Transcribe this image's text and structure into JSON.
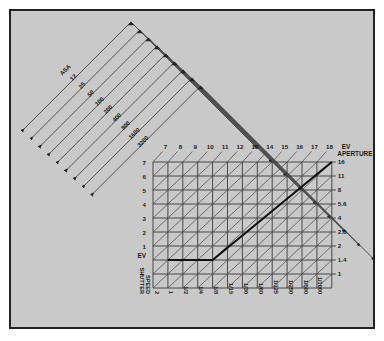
{
  "frame": {
    "background_color": "#c9c9c9",
    "border_color": "#232323",
    "page_color": "#ffffff"
  },
  "axes": {
    "ev_top": {
      "label": "EV",
      "name": "exposure-value",
      "ticks": [
        "7",
        "8",
        "9",
        "10",
        "11",
        "12",
        "13",
        "14",
        "15",
        "16",
        "17",
        "18"
      ]
    },
    "ev_left": {
      "label": "EV",
      "name": "exposure-value",
      "ticks": [
        "7",
        "6",
        "5",
        "4",
        "3",
        "2",
        "1"
      ]
    },
    "aperture": {
      "label": "APERTURE",
      "name": "aperture",
      "ticks": [
        "16",
        "11",
        "8",
        "5.6",
        "4",
        "2.8",
        "2",
        "1.4",
        "1"
      ]
    },
    "shutter": {
      "label_line1": "SHUTTER",
      "label_line2": "SPEED",
      "name": "shutter-speed",
      "ticks": [
        "2",
        "1",
        "1/2",
        "1/4",
        "1/8",
        "1/15",
        "1/30",
        "1/60",
        "1/125",
        "1/250",
        "1/500",
        "1/1000"
      ]
    },
    "asa": {
      "label": "ASA",
      "name": "film-speed",
      "ticks": [
        "12",
        "25",
        "50",
        "100",
        "200",
        "400",
        "800",
        "1600",
        "3200"
      ]
    }
  },
  "chart_data": {
    "type": "line",
    "xlabel": "SHUTTER SPEED",
    "ylabel": "APERTURE",
    "grid": true,
    "legend": false,
    "x": [
      "2",
      "1",
      "1/2",
      "1/4",
      "1/8",
      "1/15",
      "1/30",
      "1/60",
      "1/125",
      "1/250",
      "1/500",
      "1/1000"
    ],
    "y": [
      "1",
      "1.4",
      "2",
      "2.8",
      "4",
      "5.6",
      "8",
      "11",
      "16"
    ],
    "ev_top": [
      "7",
      "8",
      "9",
      "10",
      "11",
      "12",
      "13",
      "14",
      "15",
      "16",
      "17",
      "18"
    ],
    "ev_left": [
      "7",
      "6",
      "5",
      "4",
      "3",
      "2",
      "1"
    ],
    "asa": [
      "12",
      "25",
      "50",
      "100",
      "200",
      "400",
      "800",
      "1600",
      "3200"
    ],
    "series": [
      {
        "name": "exposure-path",
        "style": "bold",
        "points": [
          {
            "shutter": "1",
            "aperture": "1.4"
          },
          {
            "shutter": "1/8",
            "aperture": "1.4"
          },
          {
            "shutter": "1/15",
            "aperture": "2"
          },
          {
            "shutter": "1/30",
            "aperture": "2.8"
          },
          {
            "shutter": "1/60",
            "aperture": "4"
          },
          {
            "shutter": "1/125",
            "aperture": "5.6"
          },
          {
            "shutter": "1/250",
            "aperture": "8"
          },
          {
            "shutter": "1/500",
            "aperture": "11"
          },
          {
            "shutter": "1/1000",
            "aperture": "16"
          }
        ]
      }
    ]
  }
}
